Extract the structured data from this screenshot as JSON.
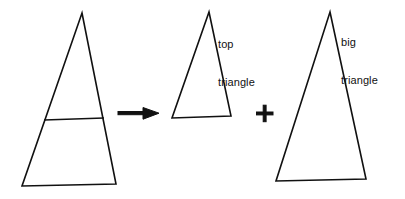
{
  "figure": {
    "kind": "geometry-decomposition-diagram",
    "background_color": "#ffffff",
    "stroke_color": "#111111",
    "text_color": "#111111",
    "canvas": {
      "width": 405,
      "height": 199
    }
  },
  "labels": {
    "top_triangle": {
      "line1": "top",
      "line2": "triangle"
    },
    "big_triangle": {
      "line1": "big",
      "line2": "triangle"
    }
  },
  "operators": {
    "arrow": {
      "glyph_name": "right-arrow-icon",
      "symbol": "→"
    },
    "plus": {
      "glyph_name": "plus-icon",
      "symbol": "+"
    }
  },
  "shapes": {
    "composite_triangle": {
      "name": "composite-triangle",
      "apex": {
        "x": 82,
        "y": 13
      },
      "base_left": {
        "x": 22,
        "y": 186
      },
      "base_right": {
        "x": 116,
        "y": 184
      },
      "divider_left": {
        "x": 44,
        "y": 120
      },
      "divider_right": {
        "x": 104,
        "y": 118
      }
    },
    "top_triangle": {
      "name": "top-triangle",
      "apex": {
        "x": 209,
        "y": 12
      },
      "base_left": {
        "x": 172,
        "y": 118
      },
      "base_right": {
        "x": 231,
        "y": 116
      }
    },
    "big_triangle": {
      "name": "big-triangle",
      "apex": {
        "x": 330,
        "y": 12
      },
      "base_left": {
        "x": 276,
        "y": 181
      },
      "base_right": {
        "x": 366,
        "y": 179
      }
    }
  }
}
